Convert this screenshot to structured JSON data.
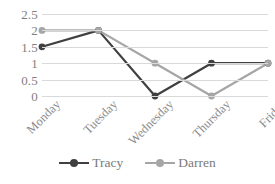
{
  "chart_data": {
    "type": "line",
    "title": "",
    "subtitle": "",
    "xlabel": "",
    "ylabel": "",
    "categories": [
      "Monday",
      "Tuesday",
      "Wednesday",
      "Thursday",
      "Friday"
    ],
    "series": [
      {
        "name": "Tracy",
        "values": [
          1.5,
          2,
          0,
          1,
          1
        ],
        "color": "#404040"
      },
      {
        "name": "Darren",
        "values": [
          2,
          2,
          1,
          0,
          1
        ],
        "color": "#a6a6a6"
      }
    ],
    "ylim": [
      0,
      2.5
    ],
    "ytick_labels": [
      "2.5",
      "2",
      "1.5",
      "1",
      "0.5",
      "0"
    ],
    "ytick_values": [
      2.5,
      2,
      1.5,
      1,
      0.5,
      0
    ],
    "grid": true,
    "grid_color": "#d9d9d9",
    "legend_position": "bottom",
    "marker": "circle",
    "xlabel_rotation": -45
  },
  "legend": {
    "items": [
      {
        "label": "Tracy",
        "color": "#404040"
      },
      {
        "label": "Darren",
        "color": "#a6a6a6"
      }
    ]
  }
}
